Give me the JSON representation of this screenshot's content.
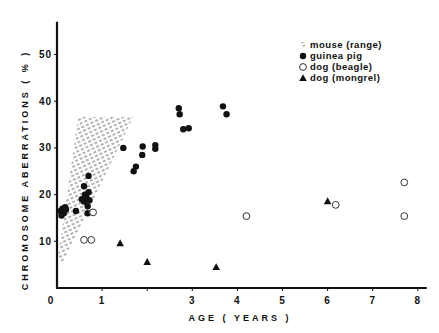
{
  "chart_data": {
    "type": "scatter",
    "title": "",
    "xlabel": "AGE ( YEARS )",
    "ylabel": "CHROMOSOME ABERRATIONS ( % )",
    "xlim": [
      0,
      8.2
    ],
    "ylim": [
      0,
      57
    ],
    "x_ticks": [
      {
        "value": 0,
        "label": "0"
      },
      {
        "value": 1,
        "label": "1"
      },
      {
        "value": 2,
        "label": ""
      },
      {
        "value": 3,
        "label": "3"
      },
      {
        "value": 4,
        "label": "4"
      },
      {
        "value": 5,
        "label": "5"
      },
      {
        "value": 6,
        "label": "6"
      },
      {
        "value": 7,
        "label": "7"
      },
      {
        "value": 8,
        "label": "8"
      }
    ],
    "y_ticks": [
      {
        "value": 10,
        "label": "10"
      },
      {
        "value": 20,
        "label": "20"
      },
      {
        "value": 30,
        "label": "30"
      },
      {
        "value": 40,
        "label": "40"
      },
      {
        "value": 50,
        "label": "50"
      }
    ],
    "grid": false,
    "legend_position": "top-right",
    "series": [
      {
        "name": "mouse (range)",
        "marker": "hatched-area",
        "polygon": [
          [
            0.47,
            36.6
          ],
          [
            1.69,
            36.6
          ],
          [
            0.1,
            4.8
          ],
          [
            0.02,
            6.5
          ]
        ]
      },
      {
        "name": "guinea pig",
        "marker": "filled-circle",
        "points": [
          [
            0.08,
            16.5
          ],
          [
            0.1,
            15.5
          ],
          [
            0.12,
            17.0
          ],
          [
            0.15,
            16.0
          ],
          [
            0.18,
            17.3
          ],
          [
            0.2,
            16.8
          ],
          [
            0.42,
            16.5
          ],
          [
            0.55,
            19.0
          ],
          [
            0.6,
            18.5
          ],
          [
            0.62,
            20.0
          ],
          [
            0.65,
            19.5
          ],
          [
            0.68,
            17.5
          ],
          [
            0.7,
            20.5
          ],
          [
            0.72,
            18.8
          ],
          [
            0.6,
            21.8
          ],
          [
            0.7,
            24.0
          ],
          [
            0.68,
            16.0
          ],
          [
            1.47,
            30.0
          ],
          [
            1.7,
            25.0
          ],
          [
            1.75,
            26.0
          ],
          [
            1.89,
            28.5
          ],
          [
            1.9,
            30.3
          ],
          [
            2.18,
            29.8
          ],
          [
            2.18,
            30.6
          ],
          [
            2.7,
            38.5
          ],
          [
            2.72,
            37.2
          ],
          [
            2.8,
            34.0
          ],
          [
            2.92,
            34.2
          ],
          [
            3.68,
            38.9
          ],
          [
            3.76,
            37.2
          ]
        ]
      },
      {
        "name": "dog (beagle)",
        "marker": "open-circle",
        "points": [
          [
            0.8,
            16.2
          ],
          [
            0.6,
            10.3
          ],
          [
            0.76,
            10.3
          ],
          [
            4.2,
            15.4
          ],
          [
            6.18,
            17.8
          ],
          [
            7.7,
            22.6
          ],
          [
            7.7,
            15.4
          ]
        ]
      },
      {
        "name": "dog (mongrel)",
        "marker": "filled-triangle",
        "points": [
          [
            1.4,
            9.6
          ],
          [
            2.0,
            5.6
          ],
          [
            3.53,
            4.5
          ],
          [
            6.0,
            18.6
          ]
        ]
      }
    ]
  }
}
